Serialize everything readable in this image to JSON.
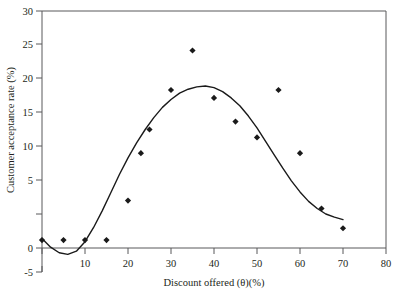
{
  "chart_data": {
    "type": "scatter",
    "title": "",
    "xlabel": "Discount offered (θ)(%)",
    "ylabel": "Customer acceptance rate (%)",
    "xlim": [
      0,
      80
    ],
    "ylim": [
      -5,
      30
    ],
    "xticks": [
      0,
      10,
      20,
      30,
      40,
      50,
      60,
      70,
      80
    ],
    "xticklabels": [
      "0",
      "10",
      "20",
      "30",
      "40",
      "50",
      "60",
      "70",
      "80"
    ],
    "yticks": [
      -5,
      0,
      5,
      10,
      15,
      20,
      25,
      30
    ],
    "yticklabels": [
      "-5",
      "0",
      "5",
      "10",
      "15",
      "20",
      "25",
      "30"
    ],
    "grid": false,
    "legend": null,
    "marker": "diamond",
    "marker_color": "#1a1a1a",
    "line_color": "#1a1a1a",
    "x": [
      0,
      5,
      10,
      15,
      20,
      23,
      25,
      30,
      35,
      40,
      45,
      50,
      55,
      60,
      65,
      70
    ],
    "y": [
      1,
      1,
      1,
      1,
      6,
      12,
      15,
      20,
      25,
      19,
      16,
      14,
      20,
      12,
      5,
      2.5
    ],
    "series": [
      {
        "name": "observed acceptance rate",
        "type": "scatter",
        "points": [
          {
            "x": 0,
            "y": 1
          },
          {
            "x": 5,
            "y": 1
          },
          {
            "x": 10,
            "y": 1
          },
          {
            "x": 15,
            "y": 1
          },
          {
            "x": 20,
            "y": 6
          },
          {
            "x": 23,
            "y": 12
          },
          {
            "x": 25,
            "y": 15
          },
          {
            "x": 30,
            "y": 20
          },
          {
            "x": 35,
            "y": 25
          },
          {
            "x": 40,
            "y": 19
          },
          {
            "x": 45,
            "y": 16
          },
          {
            "x": 50,
            "y": 14
          },
          {
            "x": 55,
            "y": 20
          },
          {
            "x": 60,
            "y": 12
          },
          {
            "x": 65,
            "y": 5
          },
          {
            "x": 70,
            "y": 2.5
          }
        ]
      },
      {
        "name": "fitted trend curve",
        "type": "line",
        "points": [
          {
            "x": 0,
            "y": 1.2
          },
          {
            "x": 2,
            "y": 0.1
          },
          {
            "x": 4,
            "y": -0.6
          },
          {
            "x": 6,
            "y": -0.8
          },
          {
            "x": 8,
            "y": -0.4
          },
          {
            "x": 10,
            "y": 0.8
          },
          {
            "x": 12,
            "y": 2.6
          },
          {
            "x": 14,
            "y": 4.7
          },
          {
            "x": 16,
            "y": 7.0
          },
          {
            "x": 18,
            "y": 9.3
          },
          {
            "x": 20,
            "y": 11.4
          },
          {
            "x": 22,
            "y": 13.3
          },
          {
            "x": 24,
            "y": 15.0
          },
          {
            "x": 26,
            "y": 16.5
          },
          {
            "x": 28,
            "y": 17.8
          },
          {
            "x": 30,
            "y": 18.8
          },
          {
            "x": 32,
            "y": 19.6
          },
          {
            "x": 34,
            "y": 20.1
          },
          {
            "x": 36,
            "y": 20.4
          },
          {
            "x": 38,
            "y": 20.5
          },
          {
            "x": 40,
            "y": 20.3
          },
          {
            "x": 42,
            "y": 19.8
          },
          {
            "x": 44,
            "y": 19.0
          },
          {
            "x": 46,
            "y": 18.0
          },
          {
            "x": 48,
            "y": 16.7
          },
          {
            "x": 50,
            "y": 15.2
          },
          {
            "x": 52,
            "y": 13.5
          },
          {
            "x": 54,
            "y": 11.8
          },
          {
            "x": 56,
            "y": 10.1
          },
          {
            "x": 58,
            "y": 8.5
          },
          {
            "x": 60,
            "y": 7.1
          },
          {
            "x": 62,
            "y": 5.9
          },
          {
            "x": 64,
            "y": 5.0
          },
          {
            "x": 66,
            "y": 4.3
          },
          {
            "x": 68,
            "y": 3.9
          },
          {
            "x": 70,
            "y": 3.6
          }
        ]
      }
    ]
  }
}
